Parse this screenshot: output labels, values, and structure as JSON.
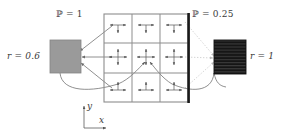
{
  "figure": {
    "background_color": "#ffffff",
    "line_color": "#4a4a4a",
    "text_color": "#3a3a3a"
  },
  "labels": {
    "prob_left": "ℙ = 1",
    "prob_right": "ℙ = 0.25",
    "refl_left": "r = 0.6",
    "refl_right": "r = 1",
    "axis_y": "y",
    "axis_x": "x"
  },
  "grid": {
    "rows": 3,
    "cols": 3,
    "border_color": "#808080",
    "thick_edge_color": "#1a1a1a",
    "thick_edge_side": "right",
    "cells": [
      {
        "row": 0,
        "col": 0,
        "arrows": [
          "left",
          "right",
          "down"
        ]
      },
      {
        "row": 0,
        "col": 1,
        "arrows": [
          "left",
          "right",
          "down"
        ]
      },
      {
        "row": 0,
        "col": 2,
        "arrows": [
          "left",
          "right",
          "down"
        ]
      },
      {
        "row": 1,
        "col": 0,
        "arrows": [
          "left",
          "right",
          "up",
          "down"
        ]
      },
      {
        "row": 1,
        "col": 1,
        "arrows": [
          "left",
          "right",
          "up",
          "down"
        ]
      },
      {
        "row": 1,
        "col": 2,
        "arrows": [
          "left",
          "right",
          "up",
          "down"
        ]
      },
      {
        "row": 2,
        "col": 0,
        "arrows": [
          "left",
          "right",
          "up"
        ]
      },
      {
        "row": 2,
        "col": 1,
        "arrows": [
          "left",
          "right",
          "up"
        ]
      },
      {
        "row": 2,
        "col": 2,
        "arrows": [
          "left",
          "right",
          "up"
        ]
      }
    ]
  },
  "blocks": {
    "left": {
      "name": "gray-absorber-block",
      "fill": "#9a9a9a",
      "stroke": "#777777",
      "pattern": "solid"
    },
    "right": {
      "name": "black-striped-block",
      "fill": "#151515",
      "stroke": "#111111",
      "pattern": "horizontal-stripes"
    }
  },
  "connectors": {
    "left_style": "solid",
    "right_style": "dotted",
    "left_color": "#6b6b6b",
    "right_color": "#bdbdbd"
  }
}
